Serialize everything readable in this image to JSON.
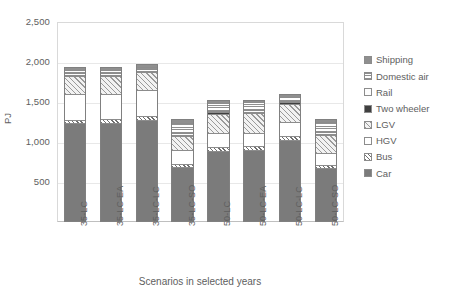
{
  "chart_data": {
    "type": "bar",
    "stacked": true,
    "title": "",
    "xlabel": "Scenarios in selected years",
    "ylabel": "PJ",
    "ylim": [
      0,
      2500
    ],
    "yticks": [
      0,
      500,
      1000,
      1500,
      2000,
      2500
    ],
    "ytick_labels": [
      "",
      "500",
      "1,000",
      "1,500",
      "2,000",
      "2,500"
    ],
    "grid": true,
    "legend_position": "right",
    "categories": [
      "35-LC",
      "35-LC-EA",
      "35-LC-LC",
      "35-LC-SO",
      "50-LC",
      "50-LC-EA",
      "50-LC-LC",
      "50-LC-SO"
    ],
    "series": [
      {
        "name": "Car",
        "pattern": "solid-dark-gray",
        "color": "#7b7b7b",
        "values": [
          1225,
          1230,
          1270,
          680,
          880,
          890,
          1020,
          660
        ]
      },
      {
        "name": "Bus",
        "pattern": "checkerboard",
        "color": "#e8e8e8",
        "values": [
          45,
          45,
          45,
          40,
          45,
          45,
          45,
          40
        ]
      },
      {
        "name": "HGV",
        "pattern": "white",
        "color": "#ffffff",
        "values": [
          320,
          320,
          325,
          170,
          175,
          175,
          175,
          150
        ]
      },
      {
        "name": "LGV",
        "pattern": "diagonal-hatch",
        "color": "#9a9a9a",
        "values": [
          230,
          225,
          230,
          180,
          250,
          250,
          235,
          235
        ]
      },
      {
        "name": "Two wheeler",
        "pattern": "solid-black",
        "color": "#3f3f3f",
        "values": [
          18,
          18,
          18,
          16,
          18,
          18,
          18,
          16
        ]
      },
      {
        "name": "Rail",
        "pattern": "white-thin",
        "color": "#fdfdfd",
        "values": [
          22,
          22,
          22,
          20,
          22,
          22,
          22,
          20
        ]
      },
      {
        "name": "Domestic air",
        "pattern": "dotted-grid",
        "color": "#ffffff",
        "values": [
          45,
          40,
          30,
          135,
          100,
          95,
          45,
          125
        ]
      },
      {
        "name": "Shipping",
        "pattern": "solid-mid-gray",
        "color": "#8f8f8f",
        "values": [
          35,
          35,
          35,
          49,
          35,
          35,
          45,
          44
        ]
      }
    ],
    "totals": [
      1940,
      1935,
      1975,
      1290,
      1525,
      1530,
      1605,
      1290
    ]
  },
  "legend": {
    "items": [
      {
        "label": "Shipping"
      },
      {
        "label": "Domestic air"
      },
      {
        "label": "Rail"
      },
      {
        "label": "Two wheeler"
      },
      {
        "label": "LGV"
      },
      {
        "label": "HGV"
      },
      {
        "label": "Bus"
      },
      {
        "label": "Car"
      }
    ]
  }
}
